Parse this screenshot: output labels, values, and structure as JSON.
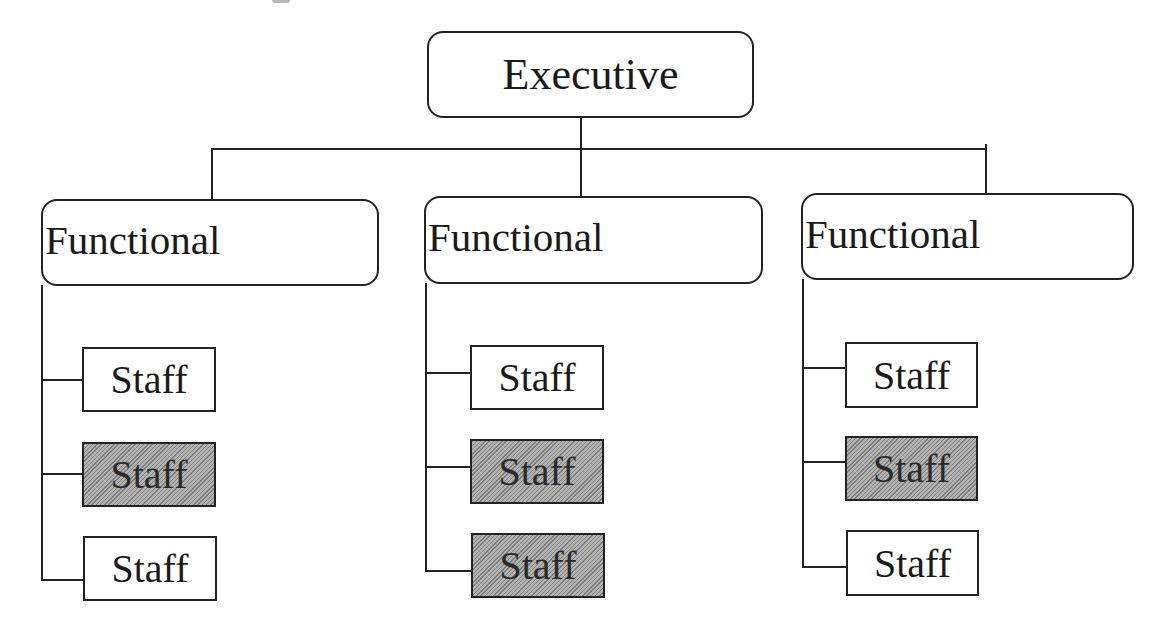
{
  "chart_title": "",
  "executive": {
    "label": "Executive"
  },
  "columns": [
    {
      "functional": {
        "label": "Functional"
      },
      "staff": [
        {
          "label": "Staff",
          "shaded": false
        },
        {
          "label": "Staff",
          "shaded": true
        },
        {
          "label": "Staff",
          "shaded": false
        }
      ]
    },
    {
      "functional": {
        "label": "Functional"
      },
      "staff": [
        {
          "label": "Staff",
          "shaded": false
        },
        {
          "label": "Staff",
          "shaded": true
        },
        {
          "label": "Staff",
          "shaded": true
        }
      ]
    },
    {
      "functional": {
        "label": "Functional"
      },
      "staff": [
        {
          "label": "Staff",
          "shaded": false
        },
        {
          "label": "Staff",
          "shaded": true
        },
        {
          "label": "Staff",
          "shaded": false
        }
      ]
    }
  ],
  "colors": {
    "line": "#222222",
    "shaded_fill": "#a0a0a0",
    "background": "#ffffff"
  }
}
